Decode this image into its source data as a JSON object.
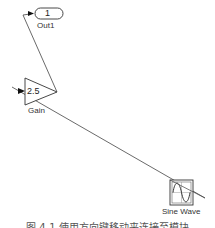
{
  "diagram": {
    "blocks": {
      "out1": {
        "name": "Out1",
        "port_number": "1"
      },
      "gain": {
        "name": "Gain",
        "value": "2.5"
      },
      "sine": {
        "name": "Sine Wave"
      }
    },
    "connections": [
      {
        "from": "Gain",
        "to": "Out1"
      },
      {
        "from": "Sine Wave",
        "to": "Gain"
      }
    ]
  },
  "caption": "图 4-1  使用方向键移动来连接至模块"
}
